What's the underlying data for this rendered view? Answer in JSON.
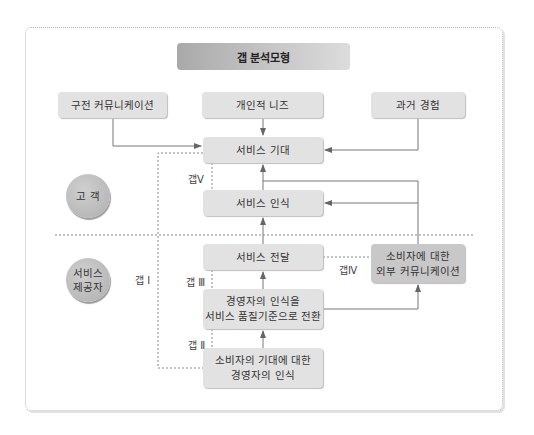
{
  "diagram": {
    "title": "갭 분석모형",
    "sources": {
      "word_of_mouth": "구전 커뮤니케이션",
      "personal_needs": "개인적 니즈",
      "past_experience": "과거 경험"
    },
    "customer_side": {
      "label": "고 객",
      "expected_service": "서비스 기대",
      "perceived_service": "서비스 인식"
    },
    "provider_side": {
      "label_line1": "서비스",
      "label_line2": "제공자",
      "service_delivery": "서비스 전달",
      "external_comm_line1": "소비자에 대한",
      "external_comm_line2": "외부 커뮤니케이션",
      "translation_line1": "경영자의 인식을",
      "translation_line2": "서비스 품질기준으로 전환",
      "mgmt_perception_line1": "소비자의 기대에 대한",
      "mgmt_perception_line2": "경영자의 인식"
    },
    "gaps": {
      "gap1": "갭 Ⅰ",
      "gap2": "갭 Ⅱ",
      "gap3": "갭 Ⅲ",
      "gap4": "갭Ⅳ",
      "gap5": "갭Ⅴ"
    },
    "colors": {
      "box": "#e2e2e2",
      "dark_box": "#c8c8c8",
      "line": "#777777",
      "dashed": "#888888"
    }
  }
}
